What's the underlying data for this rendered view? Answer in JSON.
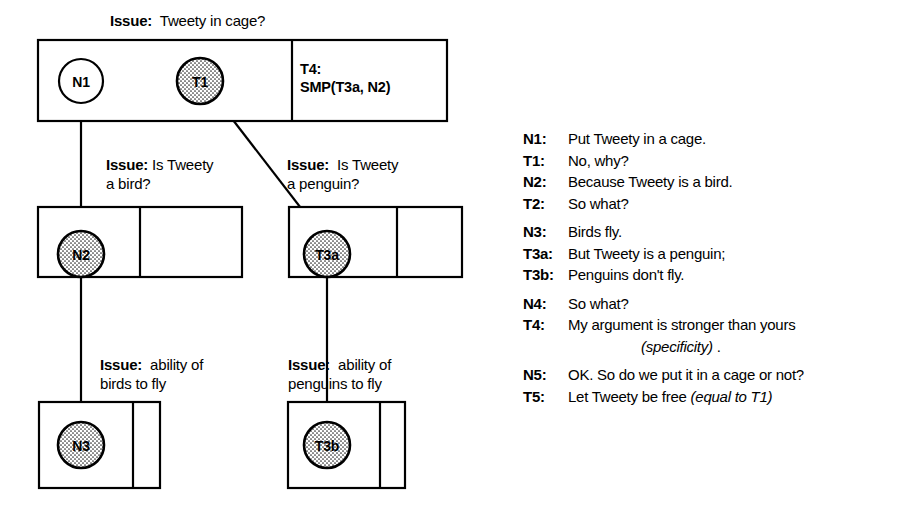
{
  "diagram": {
    "issues": {
      "top": {
        "keyword": "Issue:",
        "text": "  Tweety in cage?"
      },
      "mid_left": {
        "keyword": "Issue:",
        "text": " Is Tweety\na bird?"
      },
      "mid_right": {
        "keyword": "Issue:",
        "text": "  Is Tweety\na penguin?"
      },
      "bot_left": {
        "keyword": "Issue:",
        "text": "  ability of\nbirds to fly"
      },
      "bot_right": {
        "keyword": "Issue:",
        "text": "  ability of\npenguins to fly"
      }
    },
    "nodes": {
      "n1": {
        "label": "N1",
        "filled": false
      },
      "t1": {
        "label": "T1",
        "filled": true
      },
      "n2": {
        "label": "N2",
        "filled": true
      },
      "t3a": {
        "label": "T3a",
        "filled": true
      },
      "n3": {
        "label": "N3",
        "filled": true
      },
      "t3b": {
        "label": "T3b",
        "filled": true
      }
    },
    "cells": {
      "t4": "T4:\nSMP(T3a, N2)"
    },
    "colors": {
      "stroke": "#000000",
      "fill_shaded": "#d4d4d4",
      "fill_plain": "#ffffff",
      "background": "#ffffff"
    }
  },
  "legend": {
    "rows": [
      {
        "key": "N1:",
        "value": "Put Tweety in a cage.",
        "gap": false
      },
      {
        "key": "T1:",
        "value": "No, why?",
        "gap": false
      },
      {
        "key": "N2:",
        "value": "Because Tweety is a bird.",
        "gap": false
      },
      {
        "key": "T2:",
        "value": "So what?",
        "gap": false
      },
      {
        "key": "N3:",
        "value": "Birds fly.",
        "gap": true
      },
      {
        "key": "T3a:",
        "value": "But Tweety is a penguin;",
        "gap": false
      },
      {
        "key": "T3b:",
        "value": "Penguins don't fly.",
        "gap": false
      },
      {
        "key": "N4:",
        "value": "So what?",
        "gap": true
      },
      {
        "key": "T4:",
        "value": "My argument is stronger than yours",
        "gap": false
      },
      {
        "key": "N5:",
        "value": "OK. So do we put it in a cage or not?",
        "gap": true
      },
      {
        "key": "T5:",
        "value": "Let Tweety be free ",
        "value_italic": "(equal to T1)",
        "gap": false
      }
    ],
    "t4_continuation": {
      "italic": "(specificity)",
      "tail": " ."
    }
  }
}
